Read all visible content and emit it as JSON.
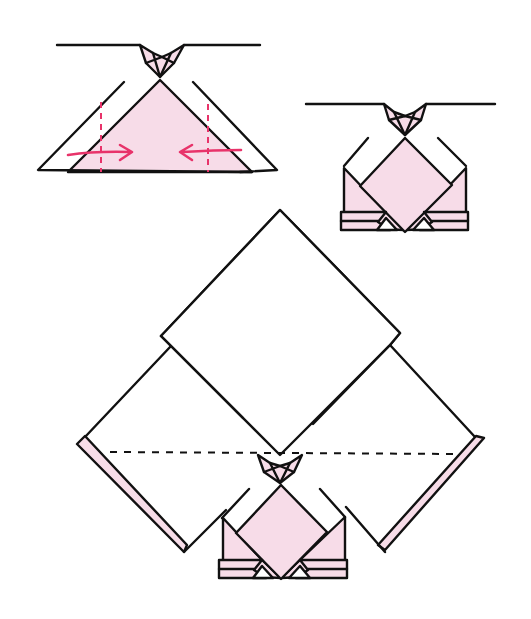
{
  "diagram": {
    "title": "Origami folding steps",
    "colors": {
      "paper_pink": "#f7dce8",
      "line": "#111111",
      "arrow": "#e8336a",
      "paper_white": "#ffffff"
    },
    "steps": [
      {
        "id": "step-1",
        "description": "Fold both sides inward along dashed valley lines",
        "shapes": {
          "top_line": "M57,45 L143,45 L150,52 L175,52 L183,45 L260,45",
          "collar": "M141,45 L150,66 L160,72 L170,66 L184,45 L172,52 L162,58 L152,52 Z",
          "collar_pink_l": "M145,52 L158,70 L152,60 Z",
          "pink_triangle": "M68,172 L160,80 L252,172 Z",
          "left_flap": "M124,82 L38,170 L68,172",
          "right_flap": "M193,82 L277,170 L252,172",
          "dash_l": "M102,100 L102,172",
          "dash_r": "M206,100 L206,172",
          "arrow_l": "M70,155 Q95,152 128,152 M118,145 L130,152 L118,160",
          "arrow_r": "M240,152 Q215,150 183,152 M193,144 L181,152 L193,160"
        }
      },
      {
        "id": "step-2",
        "description": "Result after folding sides; bottom band folded up",
        "shapes": {
          "top_line": "M306,104 L384,104 L392,110 L413,110 L420,104 L495,104",
          "collar": "M383,104 L391,120 L405,134 L418,120 L426,104 L416,110 L405,116 L394,110 Z",
          "diamond": "M405,137 L451,183 L405,229 L359,183 Z",
          "left_body": "M344,168 L344,224 L405,229 L344,168",
          "right_body": "M466,168 L466,224 L405,229 L466,168",
          "left_shoulder": "M369,138 L344,168",
          "right_shoulder": "M438,138 L466,168",
          "band": "M341,212 L468,212 L468,230 L341,230 Z"
        }
      },
      {
        "id": "step-3",
        "description": "Large square placed behind; fold along horizontal dashed line",
        "shapes": {
          "top_square": "M280,210 L399,335 L280,455 L161,335 Z",
          "left_big": "M170,346 L86,437 L181,540 L226,497",
          "right_big": "M390,346 L477,437 L385,540 L347,500",
          "inner_l": "M170,346 L243,418",
          "inner_r": "M390,346 L314,424",
          "dash_line": "M110,452 L460,454",
          "left_strip": "M77,442 L86,437 L187,545 L181,550 Z",
          "right_strip": "M477,437 L485,438 L382,550 L378,545 Z"
        }
      }
    ]
  }
}
